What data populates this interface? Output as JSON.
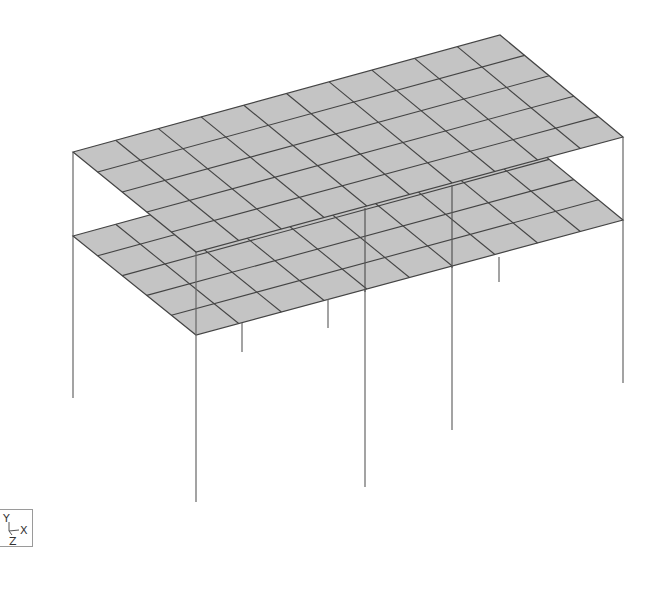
{
  "viewport": {
    "background": "#ffffff",
    "slab_fill": "#c4c4c4",
    "grid_line_color": "#444444",
    "column_color": "#666666"
  },
  "model": {
    "type": "3D structural frame model - two floor slabs on columns",
    "grid": {
      "long_divisions": 10,
      "short_divisions": 5
    },
    "slabs": [
      {
        "name": "upper-slab",
        "corners": [
          [
            73,
            152
          ],
          [
            500,
            35
          ],
          [
            623,
            137
          ],
          [
            196,
            252
          ]
        ]
      },
      {
        "name": "lower-slab",
        "corners": [
          [
            73,
            236
          ],
          [
            500,
            119
          ],
          [
            623,
            220
          ],
          [
            196,
            335
          ]
        ]
      }
    ],
    "columns": [
      {
        "name": "column-left",
        "x1": 73,
        "y1": 152,
        "x2": 73,
        "y2": 398
      },
      {
        "name": "column-right",
        "x1": 623,
        "y1": 137,
        "x2": 623,
        "y2": 383
      },
      {
        "name": "column-front",
        "x1": 196,
        "y1": 252,
        "x2": 196,
        "y2": 502
      },
      {
        "name": "column-mid-a",
        "x1": 365,
        "y1": 208,
        "x2": 365,
        "y2": 487
      },
      {
        "name": "column-mid-b",
        "x1": 452,
        "y1": 185,
        "x2": 452,
        "y2": 430
      },
      {
        "name": "column-stub-1",
        "x1": 242,
        "y1": 323,
        "x2": 242,
        "y2": 352
      },
      {
        "name": "column-stub-2",
        "x1": 328,
        "y1": 299,
        "x2": 328,
        "y2": 328
      },
      {
        "name": "column-stub-3",
        "x1": 499,
        "y1": 257,
        "x2": 499,
        "y2": 282
      }
    ]
  },
  "axis_triad": {
    "y_label": "Y",
    "x_label": "X",
    "z_label": "Z"
  }
}
